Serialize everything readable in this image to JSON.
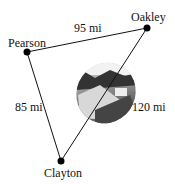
{
  "diagram": {
    "towns": [
      {
        "name": "Oakley",
        "x": 147,
        "y": 28
      },
      {
        "name": "Pearson",
        "x": 27,
        "y": 52
      },
      {
        "name": "Clayton",
        "x": 61,
        "y": 161
      }
    ],
    "distances": [
      {
        "label": "95 mi",
        "between": [
          "Pearson",
          "Oakley"
        ]
      },
      {
        "label": "85 mi",
        "between": [
          "Pearson",
          "Clayton"
        ]
      },
      {
        "label": "120 mi",
        "between": [
          "Clayton",
          "Oakley"
        ]
      }
    ],
    "image": "landscape-photo-ellipse"
  }
}
